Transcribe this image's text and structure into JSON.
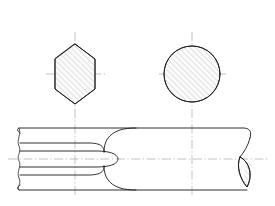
{
  "drawing": {
    "title": "Hexagon-to-round bar transition drawing",
    "background_color": "#ffffff",
    "line_color": "#1a1a1a",
    "hatch_color": "#9a9a9a",
    "centerline_color": "#9b9b9b",
    "canvas": {
      "width": 275,
      "height": 206
    },
    "views": [
      {
        "name": "hexagon-section-view",
        "type": "hexagon",
        "orientation": "point-up",
        "center": {
          "x": 75,
          "y": 74
        },
        "circumradius_x": 20,
        "circumradius_y": 30,
        "hatched": true,
        "hatch_angle_deg": 45,
        "hatch_spacing": 4
      },
      {
        "name": "circle-section-view",
        "type": "circle",
        "center": {
          "x": 192,
          "y": 74
        },
        "radius": 28,
        "hatched": true,
        "hatch_angle_deg": 45,
        "hatch_spacing": 4
      },
      {
        "name": "side-elevation-view",
        "type": "profile",
        "left": 18,
        "right": 256,
        "top": 128,
        "bottom": 190,
        "centerline_y": 159,
        "upper_inner_y": 143,
        "lower_inner_y": 175,
        "transition_start_x": 88,
        "transition_end_x": 120,
        "break_left": true,
        "break_right": true
      }
    ],
    "centerlines": [
      {
        "name": "hexagon-vertical-centerline",
        "x": 75,
        "y1": 32,
        "y2": 196
      },
      {
        "name": "circle-vertical-centerline",
        "x": 192,
        "y1": 32,
        "y2": 196
      },
      {
        "name": "hexagon-horizontal-centerline",
        "y": 74,
        "x1": 46,
        "x2": 106
      },
      {
        "name": "circle-horizontal-centerline",
        "y": 74,
        "x1": 159,
        "x2": 226
      },
      {
        "name": "body-horizontal-centerline",
        "y": 159,
        "x1": 8,
        "x2": 268
      }
    ]
  }
}
